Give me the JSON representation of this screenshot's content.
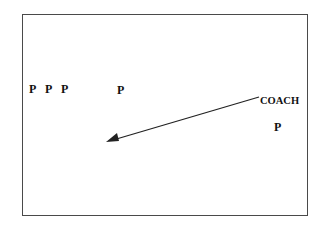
{
  "diagram": {
    "type": "coaching drill diagram",
    "border_color": "#4a4a4a",
    "text_color": "#111111",
    "players": [
      {
        "label": "P",
        "x": 29,
        "y": 83
      },
      {
        "label": "P",
        "x": 45,
        "y": 83
      },
      {
        "label": "P",
        "x": 61,
        "y": 83
      },
      {
        "label": "P",
        "x": 117,
        "y": 84
      },
      {
        "label": "P",
        "x": 274,
        "y": 121
      }
    ],
    "coach": {
      "label": "COACH",
      "x": 260,
      "y": 96
    },
    "arrow": {
      "from": [
        259,
        97
      ],
      "to": [
        106,
        142
      ],
      "color": "#222222"
    }
  }
}
